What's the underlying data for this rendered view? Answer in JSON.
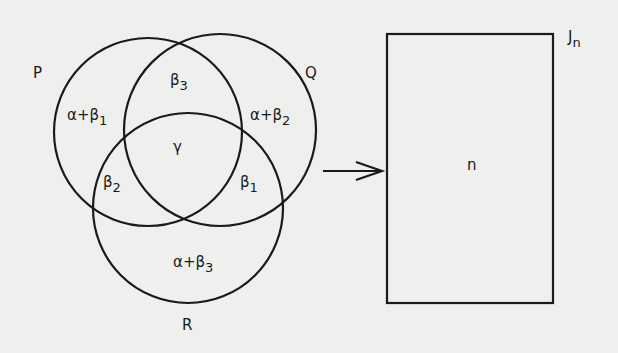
{
  "venn": {
    "sets": [
      {
        "name": "P",
        "label": "P"
      },
      {
        "name": "Q",
        "label": "Q"
      },
      {
        "name": "R",
        "label": "R"
      }
    ],
    "regions": {
      "p_only": {
        "base": "α+β",
        "sub": "1"
      },
      "q_only": {
        "base": "α+β",
        "sub": "2"
      },
      "r_only": {
        "base": "α+β",
        "sub": "3"
      },
      "pq": {
        "base": "β",
        "sub": "3"
      },
      "pr": {
        "base": "β",
        "sub": "2"
      },
      "qr": {
        "base": "β",
        "sub": "1"
      },
      "pqr": {
        "base": "γ",
        "sub": ""
      }
    }
  },
  "arrow": {
    "direction": "right"
  },
  "box": {
    "label": {
      "base": "J",
      "sub": "n"
    },
    "content": "n"
  },
  "colors": {
    "line": "#1a1a1a",
    "background": "#efefed"
  }
}
